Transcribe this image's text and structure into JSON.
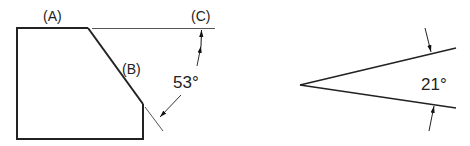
{
  "figure_left": {
    "labels": {
      "a": "(A)",
      "b": "(B)",
      "c": "(C)"
    },
    "angle_label": "53°",
    "angle_value_deg": 53
  },
  "figure_right": {
    "angle_label": "21°",
    "angle_value_deg": 21
  },
  "colors": {
    "line": "#222222",
    "extension": "#555555",
    "background": "#ffffff"
  }
}
